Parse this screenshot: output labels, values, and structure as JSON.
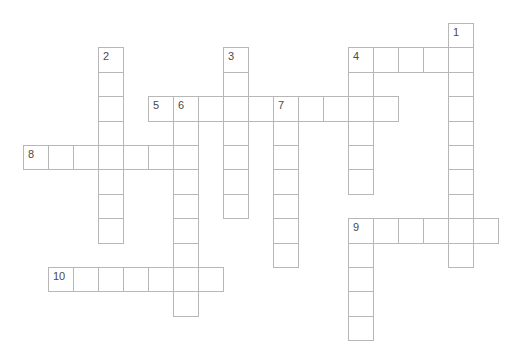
{
  "puzzle": {
    "type": "crossword",
    "grid": {
      "origin_x": 23,
      "origin_y": 23,
      "cell_width": 25,
      "cell_height": 24.4,
      "columns": 20,
      "rows": 13,
      "line_color": "#b7b7b7",
      "number_color": "#4a4a4a",
      "background_color": "#ffffff"
    },
    "visible_numbers": [
      "1",
      "2",
      "3",
      "4",
      "5",
      "6",
      "7",
      "8",
      "9",
      "10"
    ],
    "words": [
      {
        "number": "1",
        "direction": "down",
        "col": 17,
        "row": 0,
        "length": 10
      },
      {
        "number": "2",
        "direction": "down",
        "col": 3,
        "row": 1,
        "length": 8
      },
      {
        "number": "3",
        "direction": "down",
        "col": 8,
        "row": 1,
        "length": 7
      },
      {
        "number": "4",
        "direction": "across",
        "col": 13,
        "row": 1,
        "length": 5
      },
      {
        "number": "4",
        "direction": "down",
        "col": 13,
        "row": 1,
        "length": 6
      },
      {
        "number": "5",
        "direction": "across",
        "col": 5,
        "row": 3,
        "length": 10
      },
      {
        "number": "6",
        "direction": "down",
        "col": 6,
        "row": 3,
        "length": 9
      },
      {
        "number": "7",
        "direction": "down",
        "col": 10,
        "row": 3,
        "length": 7
      },
      {
        "number": "8",
        "direction": "across",
        "col": 0,
        "row": 5,
        "length": 7
      },
      {
        "number": "9",
        "direction": "across",
        "col": 13,
        "row": 8,
        "length": 6
      },
      {
        "number": "9",
        "direction": "down",
        "col": 13,
        "row": 8,
        "length": 5
      },
      {
        "number": "10",
        "direction": "across",
        "col": 1,
        "row": 10,
        "length": 7
      }
    ]
  }
}
